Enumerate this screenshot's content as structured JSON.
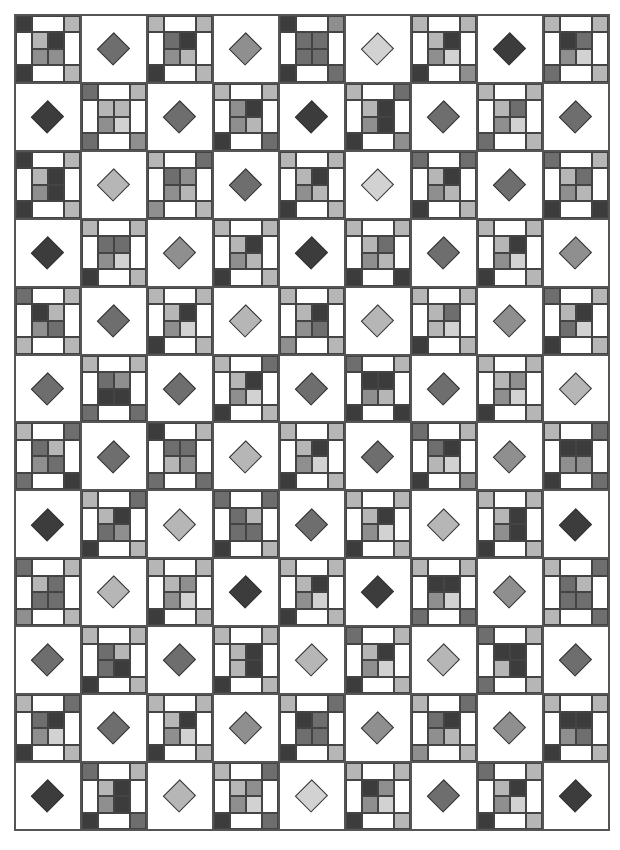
{
  "palette": {
    "D": "#3c3c3c",
    "M": "#6e6e6e",
    "G": "#8f8f8f",
    "L": "#b6b6b6",
    "P": "#d2d2d2"
  },
  "grid": {
    "columns": 9,
    "rows": 12
  },
  "blocks": [
    [
      "N:D,L,D,L|L,D,G,G",
      "D:M",
      "N:L,L,D,L|M,D,G,L",
      "D:G",
      "N:D,G,D,M|M,M,M,M",
      "D:P",
      "N:L,L,D,G|L,D,G,P",
      "D:D",
      "N:L,L,M,L|D,M,G,P"
    ],
    [
      "D:D",
      "N:M,L,M,G|L,L,G,P",
      "D:M",
      "N:L,L,D,M|G,D,G,L",
      "D:D",
      "N:L,M,D,G|L,D,G,D",
      "D:M",
      "N:L,L,M,L|L,M,G,P",
      "D:M"
    ],
    [
      "N:D,L,D,L|L,D,G,D",
      "D:L",
      "N:L,M,G,L|M,G,G,L",
      "D:M",
      "N:L,L,D,L|L,D,G,L",
      "D:P",
      "N:M,M,D,L|L,D,G,L",
      "D:M",
      "N:M,L,D,D|L,M,G,L"
    ],
    [
      "D:D",
      "N:L,L,D,L|M,M,G,P",
      "D:G",
      "N:L,L,D,L|L,D,G,L",
      "D:D",
      "N:L,L,D,D|L,M,G,L",
      "D:M",
      "N:L,L,D,L|L,D,G,P",
      "D:G"
    ],
    [
      "N:M,L,L,L|D,L,G,M",
      "D:M",
      "N:L,L,D,L|L,D,G,P",
      "D:L",
      "N:L,L,G,L|L,D,G,M",
      "D:L",
      "N:L,L,D,L|L,M,L,P",
      "D:G",
      "N:M,L,D,L|L,D,M,P"
    ],
    [
      "D:M",
      "N:L,L,M,M|M,G,D,D",
      "D:M",
      "N:L,M,D,L|L,D,G,P",
      "D:M",
      "N:M,L,D,D|D,D,G,L",
      "D:M",
      "N:L,L,D,L|L,G,G,P",
      "D:L"
    ],
    [
      "N:L,M,M,D|M,L,G,M",
      "D:M",
      "N:D,L,M,M|M,M,L,G",
      "D:L",
      "N:L,L,D,L|L,D,G,P",
      "D:M",
      "N:M,L,D,G|M,D,L,P",
      "D:G",
      "N:L,M,D,M|D,D,G,G"
    ],
    [
      "D:D",
      "N:L,M,D,L|L,D,M,G",
      "D:L",
      "N:M,M,D,L|M,L,M,M",
      "D:M",
      "N:L,L,D,L|L,D,G,P",
      "D:L",
      "N:L,L,D,L|L,D,G,D",
      "D:D"
    ],
    [
      "N:M,L,G,L|L,M,M,M",
      "D:L",
      "N:L,L,D,L|L,G,G,P",
      "D:D",
      "N:L,L,D,L|L,D,G,P",
      "D:D",
      "N:L,L,M,M|D,D,G,P",
      "D:G",
      "N:L,M,L,M|M,L,M,M"
    ],
    [
      "D:M",
      "N:L,L,D,L|M,L,M,D",
      "D:M",
      "N:L,L,D,L|L,D,L,D",
      "D:L",
      "N:M,L,D,L|L,D,G,P",
      "D:L",
      "N:M,L,M,L|D,D,L,D",
      "D:M"
    ],
    [
      "N:L,M,D,L|M,D,G,P",
      "D:M",
      "N:L,L,D,L|L,D,G,P",
      "D:G",
      "N:L,M,D,L|D,M,M,M",
      "D:G",
      "N:L,M,G,L|M,D,G,L",
      "D:G",
      "N:L,L,D,L|D,D,G,M"
    ],
    [
      "D:D",
      "N:M,L,D,M|L,D,G,D",
      "D:L",
      "N:L,M,D,M|L,G,G,P",
      "D:P",
      "N:L,L,D,L|D,G,G,P",
      "D:M",
      "N:M,L,D,L|L,D,G,P",
      "D:D"
    ]
  ]
}
